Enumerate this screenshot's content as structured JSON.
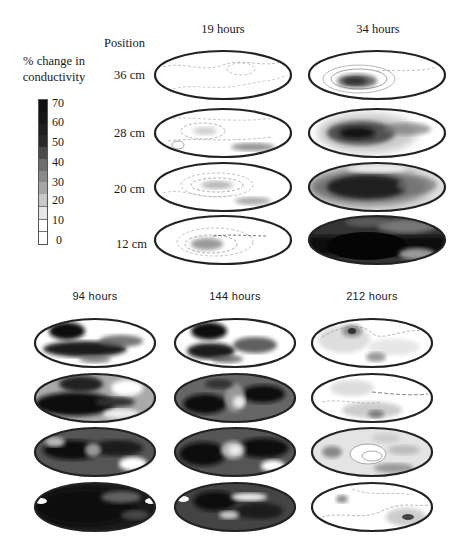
{
  "legend": {
    "title_line1": "% change in",
    "title_line2": "conductivity",
    "ticks": [
      "70",
      "60",
      "50",
      "40",
      "30",
      "20",
      "10",
      "0"
    ],
    "bins": [
      {
        "range": "60-70",
        "color": "#111111"
      },
      {
        "range": "50-60",
        "color": "#161616"
      },
      {
        "range": "45-50",
        "color": "#1e1e1e"
      },
      {
        "range": "40-45",
        "color": "#2a2a2a"
      },
      {
        "range": "35-40",
        "color": "#4a4a4a"
      },
      {
        "range": "30-35",
        "color": "#6e6e6e"
      },
      {
        "range": "25-30",
        "color": "#8a8a8a"
      },
      {
        "range": "20-25",
        "color": "#a6a6a6"
      },
      {
        "range": "15-20",
        "color": "#c8c8c8"
      },
      {
        "range": "10-15",
        "color": "#e6e6e6"
      },
      {
        "range": "5-10",
        "color": "#ffffff"
      },
      {
        "range": "0-5",
        "color": "#ffffff"
      }
    ]
  },
  "position_header": "Position",
  "positions": [
    "36 cm",
    "28 cm",
    "20 cm",
    "12 cm"
  ],
  "top_columns": [
    "19 hours",
    "34 hours"
  ],
  "bottom_columns": [
    "94 hours",
    "144 hours",
    "212 hours"
  ],
  "chart_data": {
    "type": "heatmap",
    "title": "",
    "colorbar": {
      "label": "% change in conductivity",
      "range": [
        0,
        70
      ],
      "ticks": [
        0,
        10,
        20,
        30,
        40,
        50,
        60,
        70
      ]
    },
    "rows": [
      "36 cm",
      "28 cm",
      "20 cm",
      "12 cm"
    ],
    "columns": [
      "19 hours",
      "34 hours",
      "94 hours",
      "144 hours",
      "212 hours"
    ],
    "approx_peak_change_percent": [
      [
        10,
        45,
        70,
        70,
        35
      ],
      [
        20,
        60,
        70,
        70,
        25
      ],
      [
        30,
        70,
        70,
        70,
        30
      ],
      [
        35,
        70,
        70,
        70,
        35
      ]
    ]
  }
}
